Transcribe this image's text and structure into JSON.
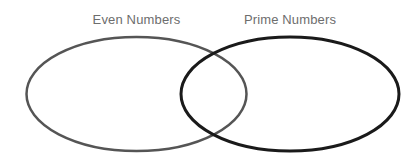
{
  "figure": {
    "type": "venn-diagram",
    "background_color": "#ffffff",
    "width": 420,
    "height": 163
  },
  "chart_data": {
    "type": "venn",
    "title": "",
    "sets": [
      {
        "id": "even-numbers",
        "label": "Even Numbers",
        "label_color": "#6d6d6d",
        "stroke_color": "#555555",
        "stroke_width": 2.5,
        "fill": "none",
        "cx": 136.5,
        "cy": 94,
        "rx": 110,
        "ry": 57
      },
      {
        "id": "prime-numbers",
        "label": "Prime Numbers",
        "label_color": "#6d6d6d",
        "stroke_color": "#1a1a1a",
        "stroke_width": 3,
        "fill": "none",
        "cx": 290,
        "cy": 94,
        "rx": 109,
        "ry": 57
      }
    ],
    "intersection": {
      "label": "",
      "x_range": [
        181,
        246
      ],
      "y_range": [
        55,
        134
      ]
    },
    "legend": "none",
    "grid": false
  },
  "labels": {
    "left": "Even Numbers",
    "right": "Prime Numbers"
  }
}
